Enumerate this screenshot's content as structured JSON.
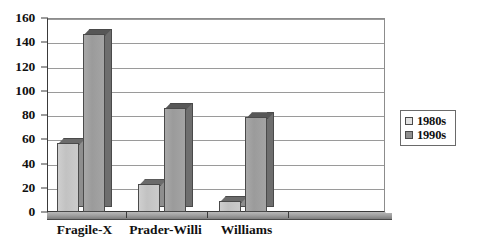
{
  "chart_data": {
    "type": "bar",
    "title": "",
    "subtitle": "",
    "xlabel": "",
    "ylabel": "",
    "categories": [
      "Fragile-X",
      "Prader-Willi",
      "Williams"
    ],
    "series": [
      {
        "name": "1980s",
        "values": [
          57,
          23,
          9
        ],
        "color": "#cbcbcb"
      },
      {
        "name": "1990s",
        "values": [
          147,
          86,
          78
        ],
        "color": "#a0a0a0"
      }
    ],
    "ylim": [
      0,
      160
    ],
    "yticks": [
      0,
      20,
      40,
      60,
      80,
      100,
      120,
      140,
      160
    ],
    "ytick_labels": [
      "0",
      "20",
      "40",
      "60",
      "80",
      "100",
      "120",
      "140",
      "160"
    ],
    "grid": true,
    "grid_axis": "y",
    "legend_position": "right",
    "style": "3d-bar",
    "background": "#ffffff",
    "axis_color": "#3a3a3a",
    "grid_color": "#9a9a9a"
  },
  "legend": {
    "entries": [
      {
        "label": "1980s",
        "swatch": "light-gray-swatch"
      },
      {
        "label": "1990s",
        "swatch": "dark-gray-swatch"
      }
    ]
  }
}
